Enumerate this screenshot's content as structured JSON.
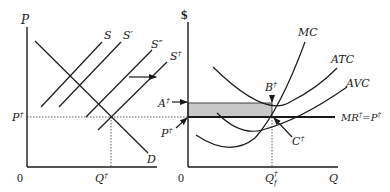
{
  "left_panel": {
    "y_axis_label": "P",
    "x_origin_label": "0",
    "price_label": "P",
    "price_sup": "†",
    "quantity_label": "Q",
    "quantity_sup": "†",
    "demand_label": "D",
    "supply_labels": [
      {
        "base": "S",
        "mark": ""
      },
      {
        "base": "S",
        "mark": "′"
      },
      {
        "base": "S",
        "mark": "″"
      },
      {
        "base": "S",
        "mark": "†"
      }
    ],
    "shift_arrow": "right-arrow"
  },
  "right_panel": {
    "y_axis_label": "$",
    "x_origin_label": "0",
    "x_axis_label": "Q",
    "curves": [
      "MC",
      "ATC",
      "AVC"
    ],
    "mr_label": "MR",
    "mr_sup": "†",
    "mr_eq": "=P",
    "mr_eq_sup": "†",
    "point_a": {
      "base": "A",
      "sup": "†"
    },
    "point_b": {
      "base": "B",
      "sup": "†"
    },
    "point_c": {
      "base": "C",
      "sup": "†"
    },
    "point_p": {
      "base": "P",
      "sup": "†"
    },
    "qf_label": {
      "base": "Q",
      "sub": "f",
      "sup": "†"
    },
    "shaded_region": "loss area",
    "shade_color": "#c8c8c8"
  },
  "caption": "(caption text cut off at bottom edge, not legible)"
}
